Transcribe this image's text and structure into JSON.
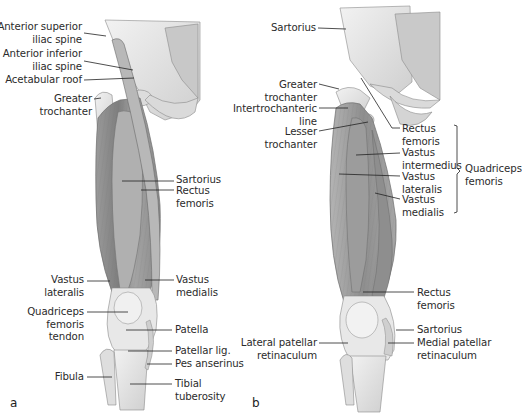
{
  "figure": {
    "panel_a": {
      "letter": "a",
      "left_labels": [
        {
          "line1": "Anterior superior",
          "line2": "iliac spine"
        },
        {
          "line1": "Anterior inferior",
          "line2": "iliac spine"
        },
        {
          "line1": "Acetabular roof",
          "line2": ""
        },
        {
          "line1": "Greater",
          "line2": "trochanter"
        },
        {
          "line1": "Vastus",
          "line2": "lateralis"
        },
        {
          "line1": "Quadriceps",
          "line2": "femoris",
          "line3": "tendon"
        },
        {
          "line1": "Fibula",
          "line2": ""
        }
      ],
      "right_labels": [
        {
          "line1": "Sartorius",
          "line2": ""
        },
        {
          "line1": "Rectus",
          "line2": "femoris"
        },
        {
          "line1": "Vastus",
          "line2": "medialis"
        },
        {
          "line1": "Patella",
          "line2": ""
        },
        {
          "line1": "Patellar lig.",
          "line2": ""
        },
        {
          "line1": "Pes anserinus",
          "line2": ""
        },
        {
          "line1": "Tibial",
          "line2": "tuberosity"
        }
      ]
    },
    "panel_b": {
      "letter": "b",
      "left_labels": [
        {
          "line1": "Sartorius",
          "line2": ""
        },
        {
          "line1": "Greater",
          "line2": "trochanter"
        },
        {
          "line1": "Intertrochanteric",
          "line2": "line"
        },
        {
          "line1": "Lesser",
          "line2": "trochanter"
        },
        {
          "line1": "Lateral patellar",
          "line2": "retinaculum"
        }
      ],
      "right_labels": [
        {
          "line1": "Rectus",
          "line2": "femoris"
        },
        {
          "line1": "Vastus",
          "line2": "intermedius"
        },
        {
          "line1": "Vastus",
          "line2": "lateralis"
        },
        {
          "line1": "Vastus",
          "line2": "medialis"
        },
        {
          "line1": "Rectus",
          "line2": "femoris"
        },
        {
          "line1": "Sartorius",
          "line2": ""
        },
        {
          "line1": "Medial patellar",
          "line2": "retinaculum"
        }
      ],
      "group_bracket": {
        "line1": "Quadriceps",
        "line2": "femoris"
      }
    },
    "colors": {
      "background": "#ffffff",
      "bone": "#e6e6e6",
      "muscle_dark": "#8c8c8c",
      "muscle_mid": "#a8a8a8",
      "tendon": "#ececec",
      "text": "#2b2b2b",
      "leader": "#222222"
    }
  }
}
